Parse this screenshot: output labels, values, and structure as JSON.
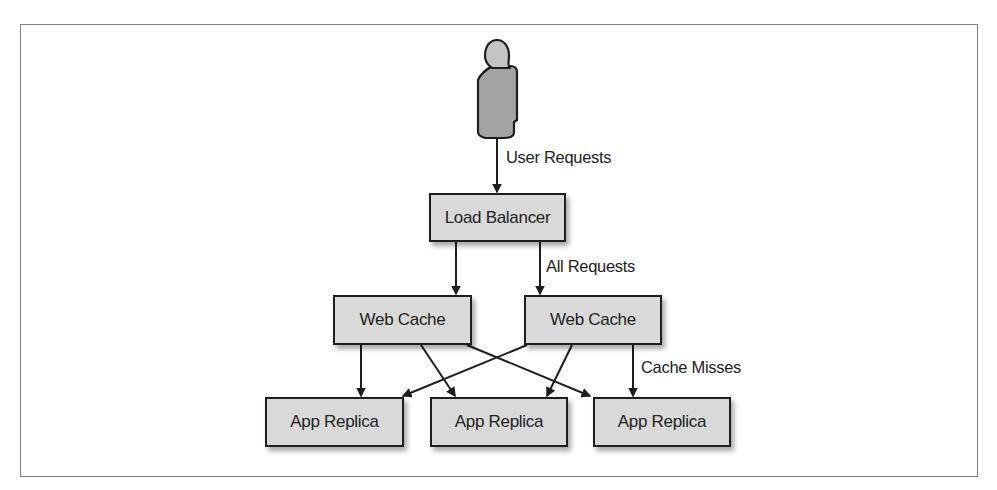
{
  "diagram": {
    "actor": {
      "name": "User",
      "icon": "person-icon"
    },
    "nodes": {
      "load_balancer": "Load Balancer",
      "web_cache_1": "Web Cache",
      "web_cache_2": "Web Cache",
      "app_replica_1": "App Replica",
      "app_replica_2": "App Replica",
      "app_replica_3": "App Replica"
    },
    "edge_labels": {
      "user_requests": "User Requests",
      "all_requests": "All Requests",
      "cache_misses": "Cache Misses"
    },
    "edges": [
      {
        "from": "User",
        "to": "Load Balancer",
        "label": "User Requests"
      },
      {
        "from": "Load Balancer",
        "to": "Web Cache (left)"
      },
      {
        "from": "Load Balancer",
        "to": "Web Cache (right)",
        "label": "All Requests"
      },
      {
        "from": "Web Cache (left)",
        "to": "App Replica 1"
      },
      {
        "from": "Web Cache (left)",
        "to": "App Replica 2"
      },
      {
        "from": "Web Cache (left)",
        "to": "App Replica 3"
      },
      {
        "from": "Web Cache (right)",
        "to": "App Replica 1"
      },
      {
        "from": "Web Cache (right)",
        "to": "App Replica 2"
      },
      {
        "from": "Web Cache (right)",
        "to": "App Replica 3",
        "label": "Cache Misses"
      }
    ],
    "colors": {
      "box_fill": "#d9d9d9",
      "box_border": "#1e1e1e",
      "person_head": "#c4c4c4",
      "person_body": "#a3a3a3",
      "frame_border": "#808080"
    }
  }
}
